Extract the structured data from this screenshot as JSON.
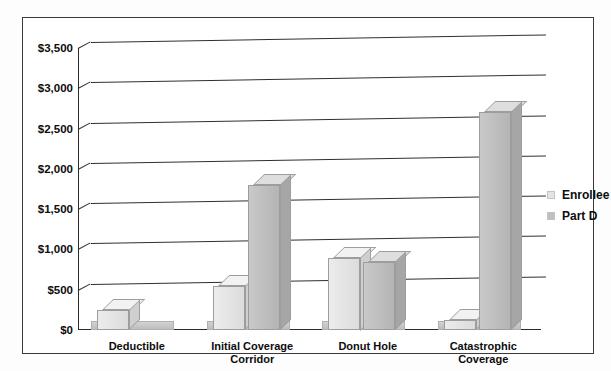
{
  "chart_data": {
    "type": "bar",
    "title": "",
    "subtitle": "",
    "xlabel": "",
    "ylabel": "",
    "categories": [
      "Deductible",
      "Initial Coverage\nCorridor",
      "Donut Hole",
      "Catastrophic\nCoverage"
    ],
    "series": [
      {
        "name": "Enrollee",
        "color": "#e4e4e4",
        "values": [
          250,
          550,
          900,
          130
        ]
      },
      {
        "name": "Part D",
        "color": "#bfbfbf",
        "values": [
          0,
          1800,
          840,
          2700
        ]
      }
    ],
    "ylim": [
      0,
      3500
    ],
    "ytick_values": [
      0,
      500,
      1000,
      1500,
      2000,
      2500,
      3000,
      3500
    ],
    "ytick_labels": [
      "$0",
      "$500",
      "$1,000",
      "$1,500",
      "$2,000",
      "$2,500",
      "$3,000",
      "$3,500"
    ],
    "grid": true,
    "legend_position": "right",
    "style": "3d-grouped-bar-grayscale"
  },
  "legend": {
    "entries": [
      {
        "label": "Enrollee",
        "color": "#e4e4e4"
      },
      {
        "label": "Part D",
        "color": "#bfbfbf"
      }
    ]
  },
  "colors": {
    "frame": "#3a3a3a",
    "axis": "#2b2b2b",
    "gridline": "#2f2f2f",
    "enrollee": "#e4e4e4",
    "part_d": "#bfbfbf",
    "text": "#0d0d0d",
    "background": "#ffffff"
  }
}
